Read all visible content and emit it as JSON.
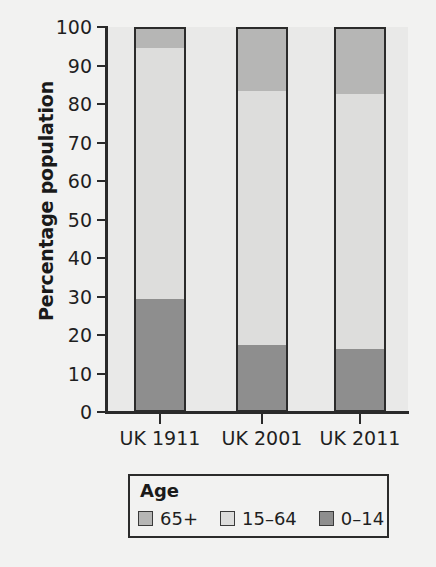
{
  "chart_data": {
    "type": "bar",
    "subtype": "stacked-bar-100-percent",
    "title": "",
    "xlabel": "",
    "ylabel": "Percentage population",
    "categories": [
      "UK 1911",
      "UK 2001",
      "UK 2011"
    ],
    "series": [
      {
        "name": "0–14",
        "color": "#8e8e8e",
        "values": [
          30,
          18,
          17
        ]
      },
      {
        "name": "15–64",
        "color": "#dddddc",
        "values": [
          65,
          66,
          66
        ]
      },
      {
        "name": "65+",
        "color": "#b6b6b5",
        "values": [
          5,
          16,
          17
        ]
      }
    ],
    "stack_order_bottom_to_top": [
      "0–14",
      "15–64",
      "65+"
    ],
    "ylim": [
      0,
      100
    ],
    "yticks": [
      0,
      10,
      20,
      30,
      40,
      50,
      60,
      70,
      80,
      90,
      100
    ],
    "ytick_labels": [
      "0",
      "10",
      "20",
      "30",
      "40",
      "50",
      "60",
      "70",
      "80",
      "90",
      "100"
    ],
    "grid": false,
    "legend_position": "bottom",
    "legend_title": "Age",
    "legend_entries": [
      "65+",
      "15–64",
      "0–14"
    ],
    "plot_background": "#e9e9e8",
    "axis_color": "#2a2a2a"
  },
  "axes": {
    "y_title": "Percentage population"
  },
  "legend": {
    "title": "Age",
    "items": [
      {
        "label": "65+",
        "color": "#b6b6b5"
      },
      {
        "label": "15–64",
        "color": "#dddddc"
      },
      {
        "label": "0–14",
        "color": "#8e8e8e"
      }
    ]
  }
}
